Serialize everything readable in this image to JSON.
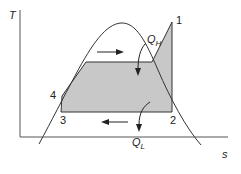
{
  "diagram": {
    "type": "T-s diagram (vapor-compression refrigeration cycle)",
    "axes": {
      "y_label": "T",
      "x_label": "s"
    },
    "states": [
      {
        "id": "1",
        "label": "1"
      },
      {
        "id": "2",
        "label": "2"
      },
      {
        "id": "3",
        "label": "3"
      },
      {
        "id": "4",
        "label": "4"
      }
    ],
    "heat_flows": {
      "q_high": {
        "symbol": "Q",
        "subscript": "H"
      },
      "q_low": {
        "symbol": "Q",
        "subscript": "L"
      }
    },
    "colors": {
      "fill": "#c8c8c8",
      "line": "#333333",
      "background": "#ffffff"
    }
  }
}
